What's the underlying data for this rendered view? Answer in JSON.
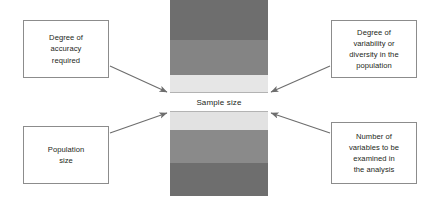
{
  "diagram": {
    "center": {
      "label": "Sample size",
      "bands": [
        {
          "name": "band-outer-top",
          "color": "#6e6e6e",
          "top": 0,
          "height": 40
        },
        {
          "name": "band-mid-top",
          "color": "#848484",
          "top": 40,
          "height": 35
        },
        {
          "name": "band-inner-top",
          "color": "#e6e6e6",
          "top": 75,
          "height": 17
        },
        {
          "name": "band-sample-size",
          "color": "#ffffff",
          "top": 92,
          "height": 20
        },
        {
          "name": "band-inner-bottom",
          "color": "#e2e2e2",
          "top": 112,
          "height": 18
        },
        {
          "name": "band-mid-bottom",
          "color": "#8a8a8a",
          "top": 130,
          "height": 33
        },
        {
          "name": "band-outer-bottom",
          "color": "#6e6e6e",
          "top": 163,
          "height": 33
        }
      ]
    },
    "boxes": [
      {
        "id": "top-left",
        "label": "Degree of\naccuracy\nrequired"
      },
      {
        "id": "bottom-left",
        "label": "Population\nsize"
      },
      {
        "id": "top-right",
        "label": "Degree of\nvariability or\ndiversity in the\npopulation"
      },
      {
        "id": "bottom-right",
        "label": "Number of\nvariables to be\nexamined in\nthe analysis"
      }
    ],
    "arrows": [
      {
        "name": "arrow-top-left-to-center",
        "from": "top-left",
        "to": "sample-size"
      },
      {
        "name": "arrow-bottom-left-to-center",
        "from": "bottom-left",
        "to": "sample-size"
      },
      {
        "name": "arrow-top-right-to-center",
        "from": "top-right",
        "to": "sample-size"
      },
      {
        "name": "arrow-bottom-right-to-center",
        "from": "bottom-right",
        "to": "sample-size"
      }
    ],
    "colors": {
      "box_border": "#8c8c8c",
      "arrow": "#6d6d6d",
      "text": "#231f20",
      "background": "#ffffff"
    }
  }
}
